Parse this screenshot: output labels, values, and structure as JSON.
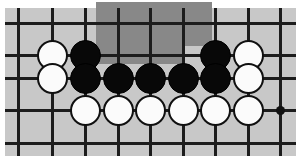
{
  "diagram": {
    "kind": "go-board-diagram",
    "board": {
      "background_color": "#c8c8c8",
      "line_color": "#1c1c1c",
      "page_color": "#ffffff",
      "left": 5,
      "top": 8,
      "width": 291,
      "height": 148,
      "line_thickness": 3,
      "column_x": [
        18,
        52,
        85,
        118,
        150,
        183,
        215,
        248,
        280
      ],
      "row_y": [
        23,
        55,
        78,
        110,
        143
      ],
      "column_count": 9,
      "row_count": 5
    },
    "highlight": {
      "label": "shaded-area",
      "color": "#888888",
      "left": 96,
      "top": 2,
      "width": 116,
      "height": 62,
      "notch": {
        "left": 182,
        "top": 46,
        "width": 30,
        "height": 18,
        "color": "#c8c8c8"
      }
    },
    "star_points": [
      {
        "label": "hoshi-right",
        "x": 280,
        "y": 110
      }
    ],
    "stone_size": 31,
    "stones": [
      {
        "label": "white-stone-r1c2",
        "color": "white",
        "x": 52,
        "y": 55
      },
      {
        "label": "black-stone-r1c3",
        "color": "black",
        "x": 85,
        "y": 55
      },
      {
        "label": "black-stone-r1c7",
        "color": "black",
        "x": 215,
        "y": 55
      },
      {
        "label": "white-stone-r1c8",
        "color": "white",
        "x": 248,
        "y": 55
      },
      {
        "label": "white-stone-r2c2",
        "color": "white",
        "x": 52,
        "y": 78
      },
      {
        "label": "black-stone-r2c3",
        "color": "black",
        "x": 85,
        "y": 78
      },
      {
        "label": "black-stone-r2c4",
        "color": "black",
        "x": 118,
        "y": 78
      },
      {
        "label": "black-stone-r2c5",
        "color": "black",
        "x": 150,
        "y": 78
      },
      {
        "label": "black-stone-r2c6",
        "color": "black",
        "x": 183,
        "y": 78
      },
      {
        "label": "black-stone-r2c7",
        "color": "black",
        "x": 215,
        "y": 78
      },
      {
        "label": "white-stone-r2c8",
        "color": "white",
        "x": 248,
        "y": 78
      },
      {
        "label": "white-stone-r3c3",
        "color": "white",
        "x": 85,
        "y": 110
      },
      {
        "label": "white-stone-r3c4",
        "color": "white",
        "x": 118,
        "y": 110
      },
      {
        "label": "white-stone-r3c5",
        "color": "white",
        "x": 150,
        "y": 110
      },
      {
        "label": "white-stone-r3c6",
        "color": "white",
        "x": 183,
        "y": 110
      },
      {
        "label": "white-stone-r3c7",
        "color": "white",
        "x": 215,
        "y": 110
      },
      {
        "label": "white-stone-r3c8",
        "color": "white",
        "x": 248,
        "y": 110
      }
    ]
  }
}
